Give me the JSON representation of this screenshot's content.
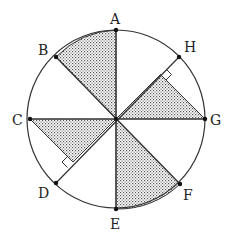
{
  "diagram": {
    "type": "geometry-circle-octants",
    "center": [
      116,
      119
    ],
    "radius": 89,
    "colors": {
      "stroke": "#333333",
      "fill": "#ffffff",
      "shade_dot": "#555555"
    },
    "points": [
      {
        "label": "A",
        "x": 116,
        "y": 30,
        "lx": 110,
        "ly": 24
      },
      {
        "label": "B",
        "x": 56,
        "y": 57,
        "lx": 38,
        "ly": 55
      },
      {
        "label": "C",
        "x": 30,
        "y": 119,
        "lx": 12,
        "ly": 125
      },
      {
        "label": "D",
        "x": 56,
        "y": 183,
        "lx": 38,
        "ly": 198
      },
      {
        "label": "E",
        "x": 116,
        "y": 209,
        "lx": 110,
        "ly": 229
      },
      {
        "label": "F",
        "x": 180,
        "y": 184,
        "lx": 183,
        "ly": 200
      },
      {
        "label": "G",
        "x": 205,
        "y": 119,
        "lx": 210,
        "ly": 125
      },
      {
        "label": "H",
        "x": 179,
        "y": 57,
        "lx": 184,
        "ly": 52
      }
    ],
    "shaded_regions": [
      "sector A-O-B",
      "triangle O-G-foot(G on OH)",
      "triangle O-C-foot(C on OD)",
      "sector E-O-F"
    ],
    "right_angle_marks": [
      "foot of perpendicular from G to OH",
      "foot of perpendicular from C to OD"
    ]
  }
}
